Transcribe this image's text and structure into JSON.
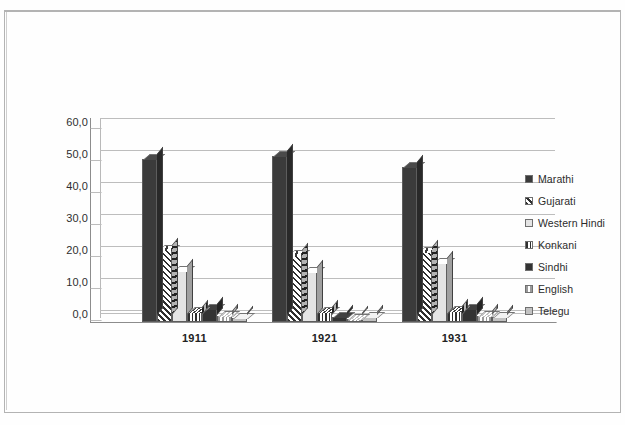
{
  "chart_data": {
    "type": "bar",
    "title": "",
    "subtitle": "",
    "xlabel": "",
    "ylabel": "",
    "categories": [
      "1911",
      "1921",
      "1931"
    ],
    "ytick_labels": [
      "60,0",
      "50,0",
      "40,0",
      "30,0",
      "20,0",
      "10,0",
      "0,0"
    ],
    "ytick_values": [
      60,
      50,
      40,
      30,
      20,
      10,
      0
    ],
    "ylim": [
      0,
      60
    ],
    "grid": true,
    "legend_position": "right",
    "style": "3d-clustered-column",
    "series": [
      {
        "name": "Marathi",
        "values": [
          51.0,
          52.0,
          48.5
        ],
        "fill": "solid-dark",
        "color": "#3b3b3b"
      },
      {
        "name": "Gujarati",
        "values": [
          22.5,
          21.0,
          22.0
        ],
        "fill": "diagonal-hatch",
        "color": "#2f2f2f"
      },
      {
        "name": "Western Hindi",
        "values": [
          16.0,
          15.5,
          18.5
        ],
        "fill": "light-solid",
        "color": "#e4e4e4"
      },
      {
        "name": "Konkani",
        "values": [
          3.0,
          3.0,
          3.5
        ],
        "fill": "vertical-stripe",
        "color": "#2f2f2f"
      },
      {
        "name": "Sindhi",
        "values": [
          4.0,
          1.5,
          4.0
        ],
        "fill": "solid-dark",
        "color": "#333333"
      },
      {
        "name": "English",
        "values": [
          2.0,
          1.0,
          2.0
        ],
        "fill": "vertical-stripe-light",
        "color": "#9a9a9a"
      },
      {
        "name": "Telegu",
        "values": [
          1.2,
          1.5,
          1.5
        ],
        "fill": "gray-solid",
        "color": "#c2c2c2"
      }
    ]
  },
  "legend": {
    "items": [
      {
        "label": "Marathi"
      },
      {
        "label": "Gujarati"
      },
      {
        "label": "Western Hindi"
      },
      {
        "label": "Konkani"
      },
      {
        "label": "Sindhi"
      },
      {
        "label": "English"
      },
      {
        "label": "Telegu"
      }
    ]
  }
}
